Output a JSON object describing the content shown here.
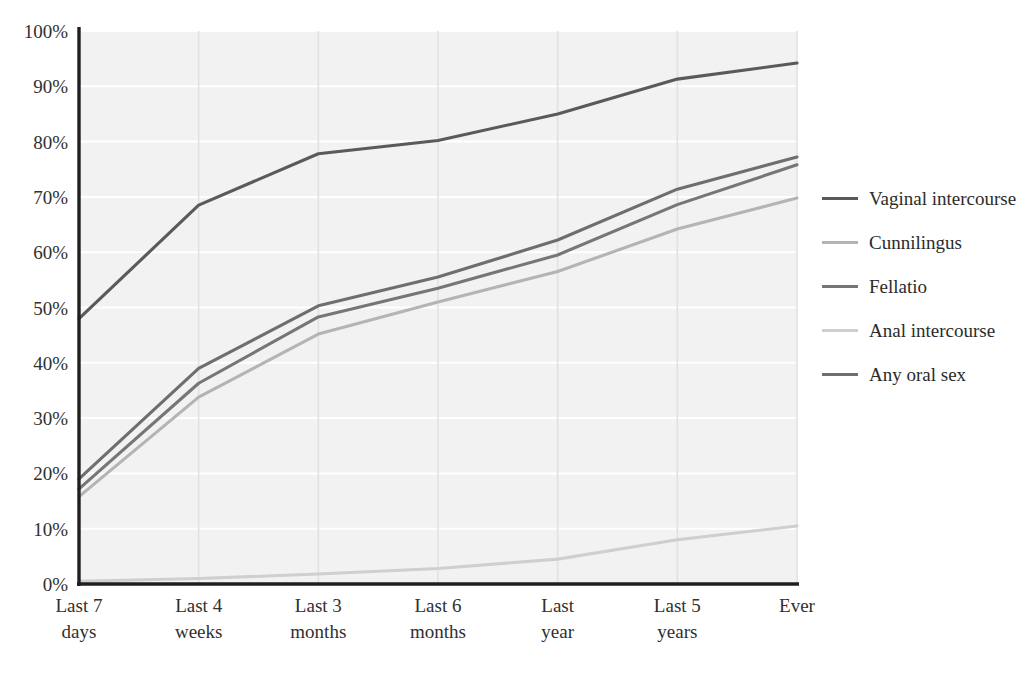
{
  "chart_data": {
    "type": "line",
    "title": "",
    "xlabel": "",
    "ylabel": "",
    "categories": [
      "Last 7 days",
      "Last 4 weeks",
      "Last 3 months",
      "Last 6 months",
      "Last year",
      "Last 5 years",
      "Ever"
    ],
    "category_lines": [
      [
        "Last 7",
        "days"
      ],
      [
        "Last 4",
        "weeks"
      ],
      [
        "Last 3",
        "months"
      ],
      [
        "Last 6",
        "months"
      ],
      [
        "Last",
        "year"
      ],
      [
        "Last 5",
        "years"
      ],
      [
        "Ever",
        ""
      ]
    ],
    "ylim": [
      0,
      100
    ],
    "ytick_values": [
      0,
      10,
      20,
      30,
      40,
      50,
      60,
      70,
      80,
      90,
      100
    ],
    "ytick_labels": [
      "0%",
      "10%",
      "20%",
      "30%",
      "40%",
      "50%",
      "60%",
      "70%",
      "80%",
      "90%",
      "100%"
    ],
    "grid": true,
    "grid_orientation": "both",
    "legend_position": "right",
    "series": [
      {
        "name": "Vaginal intercourse",
        "color": "#5a5a5a",
        "values": [
          48.0,
          68.5,
          77.8,
          80.2,
          85.0,
          91.3,
          94.2
        ]
      },
      {
        "name": "Cunnilingus",
        "color": "#b4b4b4",
        "values": [
          15.8,
          33.8,
          45.2,
          51.0,
          56.5,
          64.2,
          69.8
        ]
      },
      {
        "name": "Fellatio",
        "color": "#767676",
        "values": [
          17.2,
          36.3,
          48.3,
          53.5,
          59.5,
          68.6,
          75.8
        ]
      },
      {
        "name": "Anal intercourse",
        "color": "#cfcfcf",
        "values": [
          0.5,
          1.0,
          1.8,
          2.8,
          4.5,
          8.0,
          10.5
        ]
      },
      {
        "name": "Any oral sex",
        "color": "#6e6e6e",
        "values": [
          19.0,
          39.0,
          50.3,
          55.5,
          62.2,
          71.4,
          77.2
        ]
      }
    ]
  },
  "style": {
    "plot_background": "#f2f2f2",
    "grid_color_horizontal": "#ffffff",
    "grid_color_vertical": "#e2e2e2",
    "axis_color": "#1f1f1f",
    "text_color": "#2b2b2b"
  },
  "legend": {
    "items": [
      {
        "label": "Vaginal intercourse",
        "color": "#5a5a5a"
      },
      {
        "label": "Cunnilingus",
        "color": "#b4b4b4"
      },
      {
        "label": "Fellatio",
        "color": "#767676"
      },
      {
        "label": "Anal intercourse",
        "color": "#cfcfcf"
      },
      {
        "label": "Any oral sex",
        "color": "#6e6e6e"
      }
    ]
  }
}
